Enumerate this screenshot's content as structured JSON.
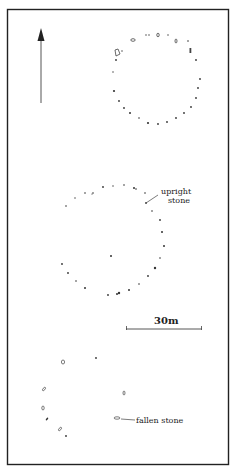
{
  "diagram": {
    "type": "site plan",
    "frame": {
      "x": 7,
      "y": 9,
      "width": 221,
      "height": 455,
      "stroke": "#222222"
    },
    "north_arrow": {
      "x": 41,
      "y_top": 28,
      "y_bottom": 103,
      "direction": "north"
    },
    "labels": {
      "upright_line1": "upright",
      "upright_line2": "stone",
      "fallen": "fallen stone",
      "scale": "30m"
    },
    "scale_bar": {
      "x1": 126,
      "x2": 202,
      "y": 329,
      "length_m": 30
    },
    "circles": [
      {
        "name": "north circle",
        "cx": 168,
        "cy": 72
      },
      {
        "name": "middle circle",
        "cx": 135,
        "cy": 250,
        "centre_stone": true
      },
      {
        "name": "south circle (partial)",
        "fallen_stones": true
      }
    ],
    "legend": {
      "upright_stone": "solid dot",
      "fallen_stone": "outlined oval"
    }
  }
}
